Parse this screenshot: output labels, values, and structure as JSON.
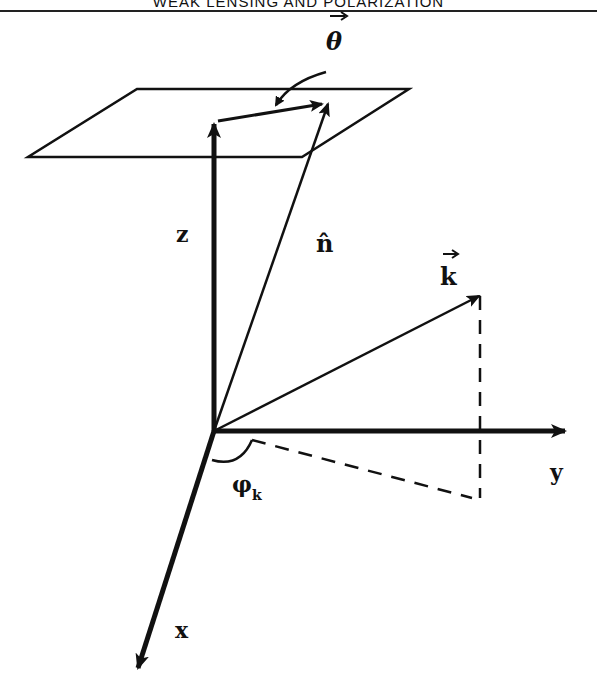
{
  "header": {
    "running_title": "WEAK LENSING AND POLARIZATION"
  },
  "diagram": {
    "type": "3d-coordinate-vector-diagram",
    "axes": [
      {
        "name": "x",
        "label": "x"
      },
      {
        "name": "y",
        "label": "y"
      },
      {
        "name": "z",
        "label": "z"
      }
    ],
    "vectors": [
      {
        "name": "theta",
        "label": "θ",
        "decoration": "vector-arrow",
        "description": "angular displacement on the sky plane"
      },
      {
        "name": "n-hat",
        "label": "n̂",
        "decoration": "hat",
        "description": "unit line-of-sight vector"
      },
      {
        "name": "k",
        "label": "k",
        "decoration": "vector-arrow",
        "description": "wave vector"
      }
    ],
    "angles": [
      {
        "name": "phi-k",
        "label": "φ",
        "subscript": "k",
        "description": "azimuthal angle of k projection from x axis"
      }
    ],
    "elements": [
      "sky plane parallelogram",
      "dashed projection of k onto x-y plane"
    ]
  },
  "labels": {
    "theta": "θ",
    "n": "n̂",
    "k": "k",
    "z": "z",
    "y": "y",
    "x": "x",
    "phi": "φ",
    "phi_sub": "k"
  }
}
